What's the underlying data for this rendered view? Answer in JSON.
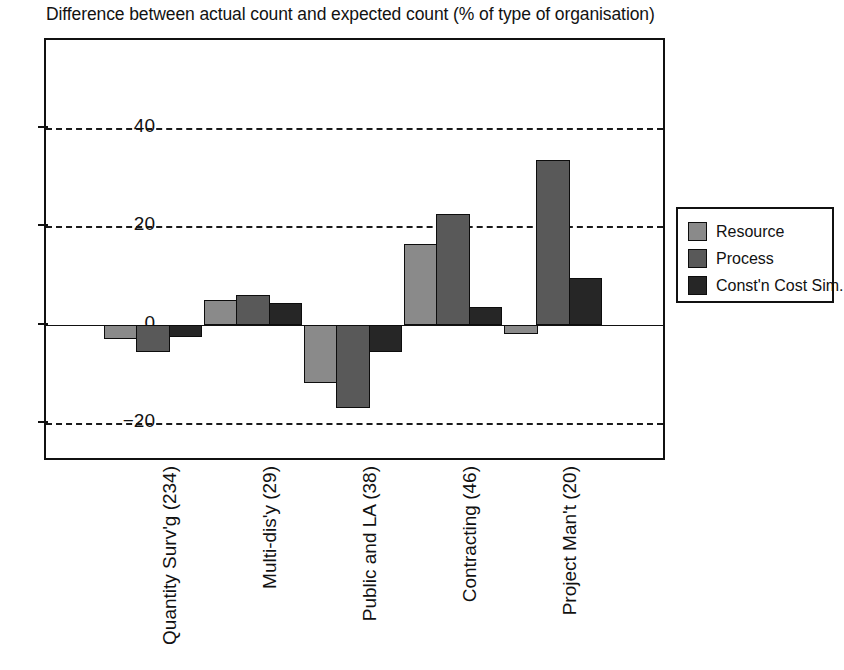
{
  "chart_data": {
    "type": "bar",
    "title": "Difference between actual count and expected count (% of type of organisation)",
    "xlabel": "",
    "ylabel": "",
    "ylim": [
      -28,
      58
    ],
    "yticks": [
      40,
      20,
      0,
      -20
    ],
    "ytick_labels": [
      "40",
      "20",
      "0",
      "−20"
    ],
    "grid": true,
    "grid_style": "dashed-horizontal",
    "legend_position": "right",
    "categories": [
      "Quantity Surv'g (234)",
      "Multi-dis'y (29)",
      "Public and LA (38)",
      "Contracting (46)",
      "Project Man't (20)"
    ],
    "series": [
      {
        "name": "Resource",
        "color": "#8a8a8a",
        "values": [
          -3,
          5,
          -12,
          16.5,
          -2
        ]
      },
      {
        "name": "Process",
        "color": "#595959",
        "values": [
          -5.5,
          6,
          -17,
          22.5,
          33.5
        ]
      },
      {
        "name": "Const'n Cost Sim.",
        "color": "#262626",
        "values": [
          -2.5,
          4.5,
          -5.5,
          3.5,
          9.5
        ]
      }
    ]
  },
  "legend": {
    "items": [
      {
        "label": "Resource",
        "swatch": "resource"
      },
      {
        "label": "Process",
        "swatch": "process"
      },
      {
        "label": "Const'n Cost Sim.",
        "swatch": "constn"
      }
    ]
  }
}
